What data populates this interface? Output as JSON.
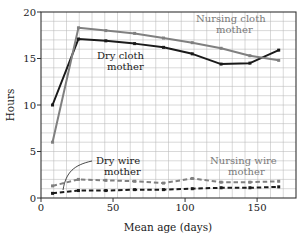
{
  "chart_data": {
    "type": "line",
    "title": "",
    "xlabel": "Mean age (days)",
    "ylabel": "Hours",
    "xlim": [
      0,
      177
    ],
    "ylim": [
      0,
      20
    ],
    "xticks": [
      0,
      50,
      100,
      150
    ],
    "xtick_labels": [
      "0",
      "50",
      "100",
      "150"
    ],
    "yticks": [
      0,
      5,
      10,
      15,
      20
    ],
    "ytick_labels": [
      "0",
      "5",
      "10",
      "15",
      "20"
    ],
    "grid": true,
    "legend_position": "inline-annotations",
    "series": [
      {
        "name": "Dry cloth mother",
        "color": "#1a1a1a",
        "style": "solid",
        "x": [
          8,
          26,
          45,
          65,
          85,
          105,
          125,
          145,
          165
        ],
        "values": [
          10.0,
          17.1,
          16.9,
          16.6,
          16.2,
          15.5,
          14.4,
          14.5,
          15.9
        ]
      },
      {
        "name": "Nursing cloth mother",
        "color": "#808080",
        "style": "solid",
        "x": [
          8,
          26,
          45,
          65,
          85,
          105,
          125,
          145,
          165
        ],
        "values": [
          6.0,
          18.3,
          18.0,
          17.7,
          17.2,
          16.7,
          16.1,
          15.3,
          14.8
        ]
      },
      {
        "name": "Dry wire mother",
        "color": "#1a1a1a",
        "style": "dashed",
        "x": [
          8,
          26,
          45,
          65,
          85,
          105,
          125,
          145,
          165
        ],
        "values": [
          0.5,
          0.8,
          0.8,
          0.9,
          0.9,
          1.0,
          1.1,
          1.1,
          1.2
        ]
      },
      {
        "name": "Nursing wire mother",
        "color": "#808080",
        "style": "dashed",
        "x": [
          8,
          26,
          45,
          65,
          85,
          105,
          125,
          145,
          165
        ],
        "values": [
          1.3,
          2.0,
          1.9,
          1.8,
          1.6,
          2.1,
          1.7,
          1.7,
          1.8
        ]
      }
    ],
    "annotations": [
      {
        "text_line1": "Nursing cloth",
        "text_line2": "mother",
        "color": "#808080"
      },
      {
        "text_line1": "Dry cloth",
        "text_line2": "mother",
        "color": "#1a1a1a"
      },
      {
        "text_line1": "Dry wire",
        "text_line2": "mother",
        "color": "#1a1a1a"
      },
      {
        "text_line1": "Nursing wire",
        "text_line2": "mother",
        "color": "#808080"
      }
    ]
  },
  "axes": {
    "y_title": "Hours",
    "x_title": "Mean age (days)",
    "x_tick_0": "0",
    "x_tick_50": "50",
    "x_tick_100": "100",
    "x_tick_150": "150",
    "y_tick_0": "0",
    "y_tick_5": "5",
    "y_tick_10": "10",
    "y_tick_15": "15",
    "y_tick_20": "20"
  },
  "labels": {
    "nursing_cloth_line1": "Nursing cloth",
    "nursing_cloth_line2": "mother",
    "dry_cloth_line1": "Dry cloth",
    "dry_cloth_line2": "mother",
    "dry_wire_line1": "Dry wire",
    "dry_wire_line2": "mother",
    "nursing_wire_line1": "Nursing wire",
    "nursing_wire_line2": "mother"
  },
  "colors": {
    "dark_series": "#1a1a1a",
    "gray_series": "#808080",
    "grid": "#b9b9b9",
    "frame": "#333333",
    "background": "#ffffff"
  }
}
